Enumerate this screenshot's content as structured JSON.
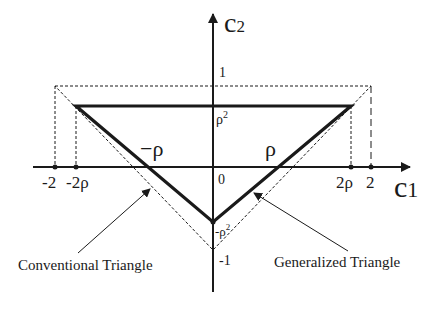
{
  "diagram": {
    "axes": {
      "x_label_main": "c",
      "x_label_sub": "1",
      "y_label_main": "c",
      "y_label_sub": "2"
    },
    "x_ticks": [
      "-2",
      "-2ρ",
      "2ρ",
      "2"
    ],
    "y_ticks": {
      "one": "1",
      "rho_sq": "ρ",
      "rho_sq_exp": "2",
      "zero": "0",
      "neg_rho_sq": "-ρ",
      "neg_rho_sq_exp": "2",
      "neg_one": "-1"
    },
    "edge_labels": {
      "left": "−ρ",
      "right": "ρ"
    },
    "annotations": {
      "conventional": "Conventional Triangle",
      "generalized": "Generalized Triangle"
    },
    "colors": {
      "ink": "#1a1a1a",
      "background": "#ffffff"
    }
  }
}
